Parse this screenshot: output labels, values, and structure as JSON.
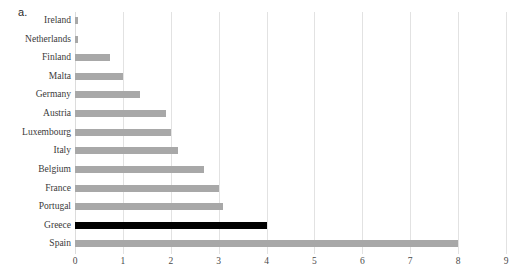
{
  "panel": {
    "letter": "a."
  },
  "chart_data": {
    "type": "bar",
    "orientation": "horizontal",
    "title": "",
    "xlabel": "",
    "ylabel": "",
    "xlim": [
      0,
      9
    ],
    "xticks": [
      "0",
      "1",
      "2",
      "3",
      "4",
      "5",
      "6",
      "7",
      "8",
      "9"
    ],
    "grid": true,
    "legend": false,
    "categories": [
      "Ireland",
      "Netherlands",
      "Finland",
      "Malta",
      "Germany",
      "Austria",
      "Luxembourg",
      "Italy",
      "Belgium",
      "France",
      "Portugal",
      "Greece",
      "Spain"
    ],
    "values": [
      0.07,
      0.07,
      0.73,
      1.0,
      1.35,
      1.9,
      2.0,
      2.15,
      2.7,
      3.0,
      3.1,
      4.0,
      8.0
    ],
    "highlight_category": "Greece",
    "colors": {
      "bar": "#a8a8a8",
      "highlight_bar": "#000000",
      "gridline": "#e2e2e2",
      "text": "#3a3a3a",
      "background": "#ffffff"
    }
  }
}
